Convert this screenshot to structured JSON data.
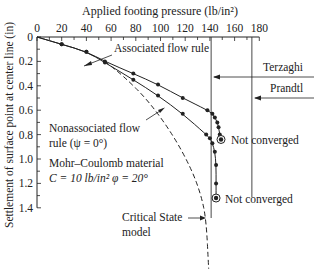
{
  "chart_data": {
    "type": "line",
    "title": "",
    "xlabel": "Applied footing pressure (lb/in²)",
    "ylabel": "Settlement of surface point at center line (in)",
    "xlim": [
      0,
      180
    ],
    "ylim": [
      0,
      1.4
    ],
    "x_ticks": [
      0,
      20,
      40,
      60,
      80,
      100,
      120,
      140,
      160,
      180
    ],
    "y_ticks": [
      0,
      0.2,
      0.4,
      0.6,
      0.8,
      1.0,
      1.2,
      1.4
    ],
    "y_tick_labels": [
      "0",
      "0.2",
      "0.4",
      "0.6",
      "0.8",
      "1.0",
      "1.2",
      "1.4"
    ],
    "x_axis_position": "top",
    "y_inverted": true,
    "grid": false,
    "series": [
      {
        "name": "Associated flow rule",
        "style": "solid-markers",
        "x": [
          0,
          20,
          40,
          55,
          78,
          98,
          118,
          138,
          142,
          144,
          146,
          147,
          148,
          149
        ],
        "y": [
          0,
          0.06,
          0.12,
          0.2,
          0.3,
          0.39,
          0.5,
          0.6,
          0.63,
          0.66,
          0.7,
          0.74,
          0.8,
          0.84
        ],
        "end_marker": "Not converged"
      },
      {
        "name": "Nonassociated flow rule (ψ=0°)",
        "style": "solid-markers",
        "x": [
          0,
          20,
          40,
          55,
          78,
          98,
          118,
          137,
          140,
          142,
          144,
          145,
          145,
          145
        ],
        "y": [
          0,
          0.06,
          0.12,
          0.21,
          0.35,
          0.48,
          0.63,
          0.8,
          0.83,
          0.87,
          0.94,
          1.05,
          1.2,
          1.32
        ],
        "end_marker": "Not converged"
      },
      {
        "name": "Critical State model",
        "style": "dashed",
        "x": [
          55,
          70,
          90,
          110,
          125,
          133,
          137,
          139
        ],
        "y": [
          0.2,
          0.32,
          0.52,
          0.8,
          1.08,
          1.3,
          1.5,
          1.9
        ]
      }
    ],
    "reference_lines": [
      {
        "name": "Terzaghi",
        "x": 141
      },
      {
        "name": "Prandtl",
        "x": 174
      }
    ],
    "annotations": [
      "Associated flow rule",
      "Terzaghi",
      "Prandtl",
      "Nonassociated flow",
      "rule (ψ=0°)",
      "Mohr–Coulomb material",
      "C = 10 lb/in² φ = 20°",
      "Not converged",
      "Not converged",
      "Critical State",
      "model"
    ]
  },
  "labels": {
    "x_axis_title": "Applied footing pressure (lb/in²)",
    "y_axis_title": "Settlement of surface point at center line (in)",
    "associated": "Associated flow rule",
    "terzaghi": "Terzaghi",
    "prandtl": "Prandtl",
    "nonassoc_1": "Nonassociated  flow",
    "nonassoc_2": "rule (ψ = 0°)",
    "material_1": "Mohr–Coulomb material",
    "material_2": "C = 10 lb/in² φ = 20°",
    "not_converged_1": "Not converged",
    "not_converged_2": "Not converged",
    "critical_1": "Critical State",
    "critical_2": "model"
  }
}
